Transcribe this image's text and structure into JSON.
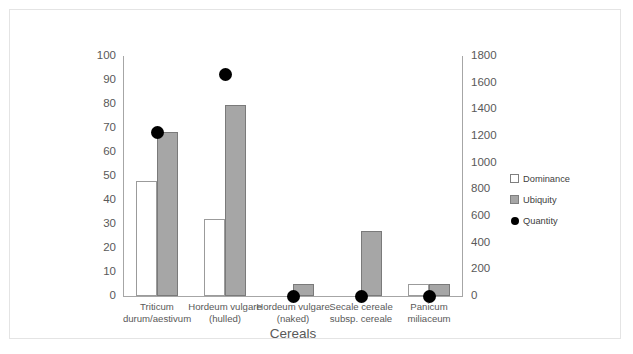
{
  "chart_data": {
    "type": "bar",
    "title": "",
    "xlabel": "Cereals",
    "ylabel": "",
    "categories": [
      "Triticum durum/aestivum",
      "Hordeum vulgare (hulled)",
      "Hordeum vulgare (naked)",
      "Secale cereale subsp. cereale",
      "Panicum miliaceum"
    ],
    "category_lines": [
      [
        "Triticum",
        "durum/aestivum"
      ],
      [
        "Hordeum vulgare",
        "(hulled)"
      ],
      [
        "Hordeum vulgare",
        "(naked)"
      ],
      [
        "Secale cereale",
        "subsp. cereale"
      ],
      [
        "Panicum",
        "miliaceum"
      ]
    ],
    "series": [
      {
        "name": "Dominance",
        "marker": "square-open",
        "axis": "left",
        "values": [
          48,
          32,
          0,
          0,
          5
        ]
      },
      {
        "name": "Ubiquity",
        "marker": "square-filled",
        "axis": "left",
        "values": [
          68.5,
          79.5,
          5,
          27,
          5
        ]
      },
      {
        "name": "Quantity",
        "marker": "circle",
        "axis": "right",
        "values": [
          1225,
          1665,
          0,
          0,
          0
        ]
      }
    ],
    "left_axis": {
      "min": 0,
      "max": 100,
      "step": 10,
      "ticks": [
        "0",
        "10",
        "20",
        "30",
        "40",
        "50",
        "60",
        "70",
        "80",
        "90",
        "100"
      ]
    },
    "right_axis": {
      "min": 0,
      "max": 1800,
      "step": 200,
      "ticks": [
        "0",
        "200",
        "400",
        "600",
        "800",
        "1000",
        "1200",
        "1400",
        "1600",
        "1800"
      ]
    },
    "grid": false,
    "legend_position": "right",
    "legend": [
      "Dominance",
      "Ubiquity",
      "Quantity"
    ],
    "colors": {
      "dominance_fill": "#ffffff",
      "dominance_border": "#9b9b9b",
      "ubiquity_fill": "#a6a6a6",
      "ubiquity_border": "#7a7a7a",
      "quantity": "#000000",
      "axis": "#a6a6a6",
      "text": "#595959",
      "frame": "#e4e4e4"
    }
  }
}
